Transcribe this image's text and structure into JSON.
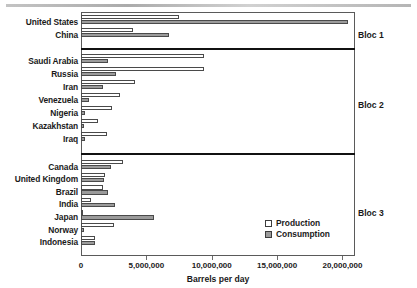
{
  "chart_data": {
    "type": "bar",
    "title": "",
    "xlabel": "Barrels per day",
    "ylabel": "",
    "orientation": "horizontal",
    "xlim": [
      0,
      20500000
    ],
    "xticks": [
      0,
      5000000,
      10000000,
      15000000,
      20000000
    ],
    "xtick_labels": [
      "0",
      "5,000,000",
      "10,000,000",
      "15,000,000",
      "20,000,000"
    ],
    "grid": false,
    "legend": {
      "position": "inside-lower-right",
      "entries": [
        "Production",
        "Consumption"
      ]
    },
    "series": [
      {
        "name": "Production",
        "fill": "#ffffff"
      },
      {
        "name": "Consumption",
        "fill": "#9b9b9b"
      }
    ],
    "groups": [
      {
        "label": "Bloc 1",
        "categories": [
          "United States",
          "China"
        ],
        "production": [
          7500000,
          4000000
        ],
        "consumption": [
          20400000,
          6700000
        ]
      },
      {
        "label": "Bloc 2",
        "categories": [
          "Saudi Arabia",
          "Russia",
          "Iran",
          "Venezuela",
          "Nigeria",
          "Kazakhstan",
          "Iraq"
        ],
        "production": [
          9400000,
          9400000,
          4100000,
          3000000,
          2400000,
          1300000,
          2000000
        ],
        "consumption": [
          2100000,
          2700000,
          1700000,
          600000,
          290000,
          230000,
          280000
        ]
      },
      {
        "label": "Bloc 3",
        "categories": [
          "Canada",
          "United Kingdom",
          "Brazil",
          "India",
          "Japan",
          "Norway",
          "Indonesia"
        ],
        "production": [
          3200000,
          1800000,
          1700000,
          800000,
          130000,
          2500000,
          1050000
        ],
        "consumption": [
          2300000,
          1750000,
          2100000,
          2600000,
          5600000,
          220000,
          1100000
        ]
      }
    ]
  },
  "axis": {
    "xlabel": "Barrels per day"
  },
  "legend": {
    "production": "Production",
    "consumption": "Consumption"
  },
  "blocs": {
    "bloc1": "Bloc 1",
    "bloc2": "Bloc 2",
    "bloc3": "Bloc 3"
  }
}
